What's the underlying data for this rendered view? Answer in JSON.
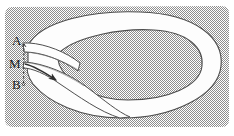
{
  "figure": {
    "kind": "mobius-strip-diagram",
    "width": 234,
    "height": 136,
    "caption": "",
    "labels": {
      "top_point": "A",
      "mid_point": "M",
      "bottom_point": "B"
    },
    "colors": {
      "page_background": "#ffffff",
      "field_background": "#b5b5b5",
      "band_fill": "#fdfdfd",
      "band_outline": "#4a4a4a",
      "label_text": "#1b1b1b",
      "arrow": "#333333",
      "dashed_segment": "#3a3a3a"
    },
    "annotations": {
      "direction_arrow": "arrow-along-band",
      "cut_segment": "dashed-segment-A-M-B"
    }
  }
}
